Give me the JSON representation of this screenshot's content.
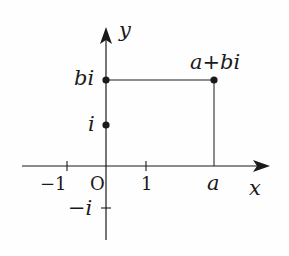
{
  "diagram": {
    "type": "complex-plane",
    "axes": {
      "x_label": "x",
      "y_label": "y",
      "origin_label": "O"
    },
    "x_ticks": [
      {
        "label": "−1",
        "value": -1
      },
      {
        "label": "1",
        "value": 1
      },
      {
        "label": "a",
        "value": "a"
      }
    ],
    "y_ticks": [
      {
        "label": "bi"
      },
      {
        "label": "i"
      },
      {
        "label": "−i"
      }
    ],
    "points": [
      {
        "label": "a+bi",
        "desc": "point (a, b)"
      },
      {
        "label": "bi",
        "desc": "point on imaginary axis"
      },
      {
        "label": "i",
        "desc": "unit imaginary point"
      }
    ],
    "colors": {
      "ink": "#1a1a1a",
      "background": "#fefefe"
    }
  },
  "labels": {
    "y": "y",
    "x": "x",
    "origin": "O",
    "neg_one": "−1",
    "one": "1",
    "a": "a",
    "bi": "bi",
    "i": "i",
    "neg_i": "−i",
    "point": "a+bi"
  }
}
